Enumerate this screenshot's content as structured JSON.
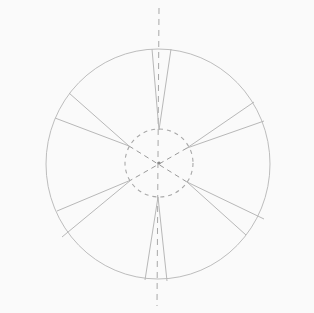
{
  "diagram": {
    "type": "technical-sketch",
    "colors": {
      "background": "#fafafa",
      "stroke": "#b8b8b8",
      "stroke_dark": "#9a9a9a"
    },
    "outer_circle": {
      "cx": 158,
      "cy": 164,
      "rx": 112,
      "ry": 115
    },
    "inner_circle": {
      "cx": 159,
      "cy": 163,
      "r": 34,
      "dashed": true
    },
    "center_point": {
      "x": 159,
      "y": 163
    },
    "axis": {
      "x1": 159,
      "y1": 8,
      "x2": 157,
      "y2": 306,
      "dashed": true
    },
    "cross_lines": [
      {
        "x1": 129,
        "y1": 146,
        "x2": 187,
        "y2": 182
      },
      {
        "x1": 187,
        "y1": 148,
        "x2": 131,
        "y2": 180
      }
    ],
    "radial_lines": [
      {
        "name": "top-wedge-left",
        "x1": 152,
        "y1": 49,
        "x2": 159,
        "y2": 130
      },
      {
        "name": "top-wedge-right",
        "x1": 171,
        "y1": 49,
        "x2": 159,
        "y2": 130
      },
      {
        "name": "upper-left-1",
        "x1": 69,
        "y1": 93,
        "x2": 129,
        "y2": 146
      },
      {
        "name": "upper-left-2",
        "x1": 55,
        "y1": 118,
        "x2": 129,
        "y2": 146
      },
      {
        "name": "upper-right-1",
        "x1": 254,
        "y1": 102,
        "x2": 187,
        "y2": 148
      },
      {
        "name": "upper-right-2",
        "x1": 264,
        "y1": 121,
        "x2": 187,
        "y2": 148
      },
      {
        "name": "lower-left-1",
        "x1": 57,
        "y1": 211,
        "x2": 131,
        "y2": 180
      },
      {
        "name": "lower-left-2",
        "x1": 62,
        "y1": 237,
        "x2": 131,
        "y2": 180
      },
      {
        "name": "lower-right-1",
        "x1": 264,
        "y1": 219,
        "x2": 187,
        "y2": 182
      },
      {
        "name": "lower-right-2",
        "x1": 246,
        "y1": 235,
        "x2": 187,
        "y2": 182
      },
      {
        "name": "bottom-wedge-left",
        "x1": 145,
        "y1": 280,
        "x2": 158,
        "y2": 197
      },
      {
        "name": "bottom-wedge-right",
        "x1": 167,
        "y1": 281,
        "x2": 158,
        "y2": 197
      }
    ]
  }
}
